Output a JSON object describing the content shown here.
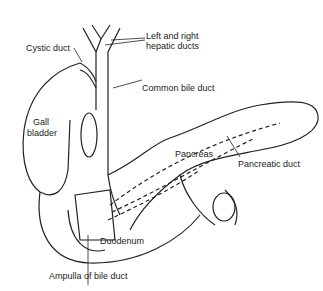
{
  "diagram": {
    "labels": {
      "hepatic_ducts_line1": "Left and right",
      "hepatic_ducts_line2": "hepatic ducts",
      "cystic_duct": "Cystic duct",
      "common_bile_duct": "Common bile duct",
      "gall_line1": "Gall",
      "gall_line2": "bladder",
      "pancreas": "Pancreas",
      "pancreatic_duct": "Pancreatic duct",
      "duodenum": "Duodenum",
      "ampulla": "Ampulla of bile duct"
    },
    "colors": {
      "line": "#222222",
      "background": "#ffffff"
    }
  }
}
